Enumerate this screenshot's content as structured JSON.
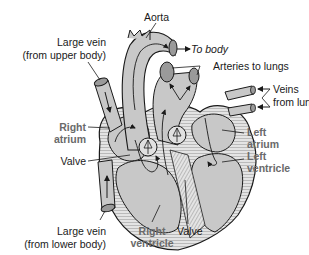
{
  "diagram": {
    "colors": {
      "tissue": "#c8c8c8",
      "tissue_dark": "#9a9a9a",
      "outline": "#1a1a1a",
      "chamber_label": "#6a6a6a",
      "text": "#1a1a1a",
      "background": "#ffffff"
    },
    "labels": {
      "aorta": "Aorta",
      "to_body": "To body",
      "arteries_to_lungs": "Arteries to lungs",
      "veins_from_lungs_1": "Veins",
      "veins_from_lungs_2": "from lungs",
      "large_vein_upper_1": "Large vein",
      "large_vein_upper_2": "(from upper body)",
      "right_atrium_1": "Right",
      "right_atrium_2": "atrium",
      "valve_left": "Valve",
      "left_atrium_1": "Left",
      "left_atrium_2": "atrium",
      "left_ventricle_1": "Left",
      "left_ventricle_2": "ventricle",
      "large_vein_lower_1": "Large vein",
      "large_vein_lower_2": "(from lower body)",
      "right_ventricle_1": "Right",
      "right_ventricle_2": "ventricle",
      "valve_bottom": "Valve"
    }
  }
}
